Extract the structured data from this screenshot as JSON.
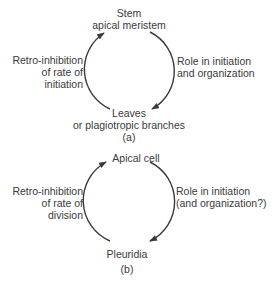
{
  "diagram_a": {
    "top_node": [
      "Stem",
      "apical meristem"
    ],
    "bottom_node": [
      "Leaves",
      "or plagiotropic branches"
    ],
    "left_edge": [
      "Retro-inhibition",
      "of rate of",
      "initiation"
    ],
    "right_edge": [
      "Role in initiation",
      "and organization"
    ],
    "caption": "(a)"
  },
  "diagram_b": {
    "top_node": [
      "Apical cell"
    ],
    "bottom_node": [
      "Pleuridia"
    ],
    "left_edge": [
      "Retro-inhibition",
      "of rate of",
      "division"
    ],
    "right_edge": [
      "Role in initiation",
      "(and organization?)"
    ],
    "caption": "(b)"
  },
  "colors": {
    "stroke": "#3a3a3a",
    "text": "#3a3a3a",
    "background": "#ffffff"
  }
}
